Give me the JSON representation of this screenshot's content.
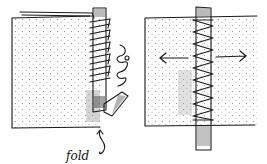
{
  "figure": {
    "panels": [
      {
        "id": "left",
        "caption": "",
        "annotations": [
          {
            "text": "fold",
            "points_to": "folded tape end at bottom of seam"
          }
        ]
      },
      {
        "id": "right",
        "caption": "",
        "annotations": [
          {
            "text": "arrows-outward",
            "meaning": "fabric pulled apart"
          }
        ]
      }
    ],
    "labels": {
      "fold": "fold"
    },
    "colors": {
      "ink": "#1a1a1a",
      "paper": "#ffffff",
      "stipple": "#555555"
    }
  }
}
